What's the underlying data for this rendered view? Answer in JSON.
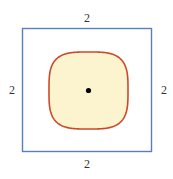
{
  "figure": {
    "canvas": {
      "width": 173,
      "height": 179,
      "background": "#ffffff"
    },
    "square": {
      "name": "outer-square",
      "stroke_color": "#5a7fbf",
      "fill": "none",
      "stroke_width": 1.4,
      "x": 22.5,
      "y": 28.5,
      "width": 129,
      "height": 123
    },
    "superellipse": {
      "name": "inner-squircle",
      "stroke_color": "#cc4a28",
      "fill_color": "#fbf4cf",
      "stroke_width": 1.6,
      "center_x": 88.5,
      "center_y": 90.5,
      "radius_x": 39.5,
      "radius_y": 38.5,
      "exponent": 3.4
    },
    "center_point": {
      "name": "center-dot",
      "color": "#000000",
      "x": 88.5,
      "y": 90.5,
      "radius": 2.6
    },
    "labels": {
      "top": "2",
      "right": "2",
      "bottom": "2",
      "left": "2",
      "color": "#33332f"
    }
  }
}
